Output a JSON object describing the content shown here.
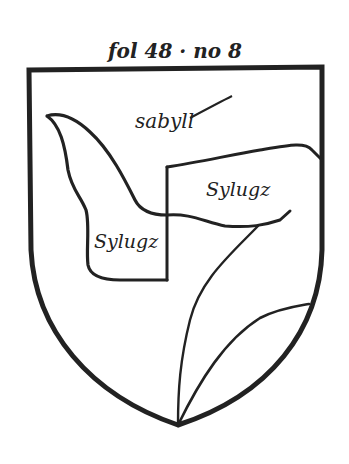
{
  "figure": {
    "caption": "fol 48 · no 8",
    "colors": {
      "ink": "#222222",
      "paper": "#ffffff"
    }
  },
  "shield": {
    "labels": {
      "chief": "sabyll",
      "right_flag": "Sylugz",
      "left_flag": "Sylugz"
    }
  }
}
